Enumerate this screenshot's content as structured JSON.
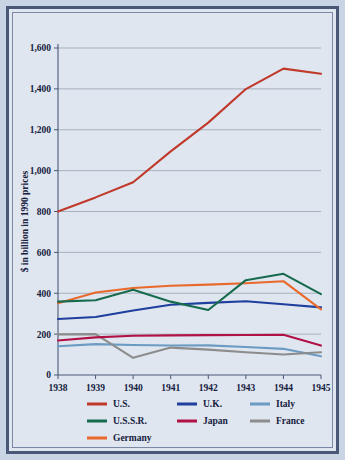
{
  "chart_data": {
    "type": "line",
    "title": "",
    "xlabel": "",
    "ylabel": "$ in billion in 1990 prices",
    "categories": [
      "1938",
      "1939",
      "1940",
      "1941",
      "1942",
      "1943",
      "1944",
      "1945"
    ],
    "x": [
      1938,
      1939,
      1940,
      1941,
      1942,
      1943,
      1944,
      1945
    ],
    "ylim": [
      0,
      1600
    ],
    "xlim": [
      1938,
      1945
    ],
    "yticks": [
      0,
      200,
      400,
      600,
      800,
      1000,
      1200,
      1400,
      1600
    ],
    "ytick_labels": [
      "0",
      "200",
      "400",
      "600",
      "800",
      "1,000",
      "1,200",
      "1,400",
      "1,600"
    ],
    "xtick_labels": [
      "1938",
      "1939",
      "1940",
      "1941",
      "1942",
      "1943",
      "1944",
      "1945"
    ],
    "grid": true,
    "legend_position": "bottom",
    "series": [
      {
        "name": "U.S.",
        "color": "#c0392b",
        "values": [
          800,
          869,
          943,
          1094,
          1235,
          1399,
          1499,
          1474
        ]
      },
      {
        "name": "U.S.S.R.",
        "color": "#176b4d",
        "values": [
          359,
          366,
          417,
          359,
          318,
          464,
          495,
          396
        ]
      },
      {
        "name": "Germany",
        "color": "#e8692b",
        "values": [
          351,
          404,
          426,
          437,
          442,
          449,
          459,
          321
        ]
      },
      {
        "name": "U.K.",
        "color": "#1f3f9e",
        "values": [
          274,
          284,
          316,
          344,
          353,
          361,
          346,
          331
        ]
      },
      {
        "name": "Japan",
        "color": "#b01246",
        "values": [
          169,
          184,
          192,
          194,
          195,
          196,
          197,
          144
        ]
      },
      {
        "name": "Italy",
        "color": "#6b9bc3",
        "values": [
          141,
          151,
          147,
          144,
          145,
          137,
          128,
          92
        ]
      },
      {
        "name": "France",
        "color": "#8c8c8c",
        "values": [
          199,
          200,
          84,
          134,
          124,
          111,
          100,
          111
        ]
      }
    ]
  },
  "legend": {
    "entries": [
      {
        "label": "U.S.",
        "color": "#c0392b",
        "col": 0,
        "row": 0
      },
      {
        "label": "U.S.S.R.",
        "color": "#176b4d",
        "col": 0,
        "row": 1
      },
      {
        "label": "Germany",
        "color": "#e8692b",
        "col": 0,
        "row": 2
      },
      {
        "label": "U.K.",
        "color": "#1f3f9e",
        "col": 1,
        "row": 0
      },
      {
        "label": "Japan",
        "color": "#b01246",
        "col": 1,
        "row": 1
      },
      {
        "label": "Italy",
        "color": "#6b9bc3",
        "col": 2,
        "row": 0
      },
      {
        "label": "France",
        "color": "#8c8c8c",
        "col": 2,
        "row": 1
      }
    ]
  },
  "theme": {
    "background": "#dfe6ef",
    "page_background": "#c9d4e4",
    "border_outer": "#4a5878",
    "border_inner": "#7b88a6",
    "grid_color": "#8f9aa8",
    "text_color": "#16213e"
  }
}
